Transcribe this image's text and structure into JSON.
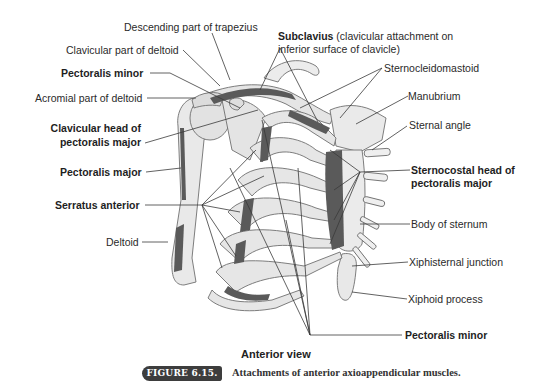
{
  "figure": {
    "number": "FIGURE 6.15.",
    "caption": "Attachments of anterior axioappendicular muscles.",
    "view_label": "Anterior view"
  },
  "labels": {
    "left": [
      {
        "id": "descending-trapezius",
        "text": "Descending part of trapezius",
        "bold": false
      },
      {
        "id": "clavicular-deltoid",
        "text": "Clavicular part of deltoid",
        "bold": false
      },
      {
        "id": "pectoralis-minor-top",
        "text": "Pectoralis minor",
        "bold": true
      },
      {
        "id": "acromial-deltoid",
        "text": "Acromial part of deltoid",
        "bold": false
      },
      {
        "id": "clavicular-head-pm-1",
        "text": "Clavicular head of",
        "bold": true
      },
      {
        "id": "clavicular-head-pm-2",
        "text": "pectoralis major",
        "bold": true
      },
      {
        "id": "pectoralis-major",
        "text": "Pectoralis major",
        "bold": true
      },
      {
        "id": "serratus-anterior",
        "text": "Serratus anterior",
        "bold": true
      },
      {
        "id": "deltoid",
        "text": "Deltoid",
        "bold": false
      }
    ],
    "right": [
      {
        "id": "subclavius-bold",
        "text": "Subclavius",
        "bold": true
      },
      {
        "id": "subclavius-rest-1",
        "text": " (clavicular attachment on",
        "bold": false
      },
      {
        "id": "subclavius-rest-2",
        "text": "inferior surface of clavicle)",
        "bold": false
      },
      {
        "id": "sternocleidomastoid",
        "text": "Sternocleidomastoid",
        "bold": false
      },
      {
        "id": "manubrium",
        "text": "Manubrium",
        "bold": false
      },
      {
        "id": "sternal-angle",
        "text": "Sternal angle",
        "bold": false
      },
      {
        "id": "sternocostal-head-1",
        "text": "Sternocostal head of",
        "bold": true
      },
      {
        "id": "sternocostal-head-2",
        "text": "pectoralis major",
        "bold": true
      },
      {
        "id": "body-of-sternum",
        "text": "Body of sternum",
        "bold": false
      },
      {
        "id": "xiphisternal-junction",
        "text": "Xiphisternal junction",
        "bold": false
      },
      {
        "id": "xiphoid-process",
        "text": "Xiphoid process",
        "bold": false
      },
      {
        "id": "pectoralis-minor-bottom",
        "text": "Pectoralis minor",
        "bold": true
      }
    ]
  },
  "colors": {
    "bone": "#e9e9e9",
    "bone_outline": "#6f6f6f",
    "muscle_attachment": "#5a5a5a",
    "leader": "#3a3a3a",
    "caption_badge": "#3d3d3d"
  }
}
